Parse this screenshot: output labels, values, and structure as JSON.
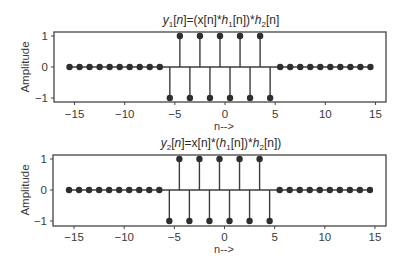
{
  "chart_data": [
    {
      "type": "stem",
      "title": "y1[n]=(x[n]*h1[n])*h2[n]",
      "title_parts": {
        "y": "y",
        "sub1": "1",
        "mid": "[n]=(x[n]*",
        "h1": "h",
        "sub_h1": "1",
        "mid2": "[n])*",
        "h2": "h",
        "sub_h2": "2",
        "end": "[n]"
      },
      "xlabel": "n-->",
      "ylabel": "Amplitude",
      "xlim": [
        -17,
        16
      ],
      "ylim": [
        -1.1,
        1.1
      ],
      "xticks": [
        -15,
        -10,
        -5,
        0,
        5,
        10,
        15
      ],
      "yticks": [
        -1,
        0,
        1
      ],
      "x": [
        -15.5,
        -14.5,
        -13.5,
        -12.5,
        -11.5,
        -10.5,
        -9.5,
        -8.5,
        -7.5,
        -6.5,
        -5.5,
        -4.5,
        -3.5,
        -2.5,
        -1.5,
        -0.5,
        0.5,
        1.5,
        2.5,
        3.5,
        4.5,
        5.5,
        6.5,
        7.5,
        8.5,
        9.5,
        10.5,
        11.5,
        12.5,
        13.5,
        14.5
      ],
      "values": [
        0,
        0,
        0,
        0,
        0,
        0,
        0,
        0,
        0,
        0,
        -1,
        1,
        -1,
        1,
        -1,
        1,
        -1,
        1,
        -1,
        1,
        -1,
        0,
        0,
        0,
        0,
        0,
        0,
        0,
        0,
        0,
        0
      ],
      "grid": false
    },
    {
      "type": "stem",
      "title": "y2[n]=x[n]*(h1[n])*h2[n])",
      "title_parts": {
        "y": "y",
        "sub1": "2",
        "mid": "[n]=x[n]*(",
        "h1": "h",
        "sub_h1": "1",
        "mid2": "[n])*",
        "h2": "h",
        "sub_h2": "2",
        "end": "[n])"
      },
      "xlabel": "n-->",
      "ylabel": "Amplitude",
      "xlim": [
        -17,
        16
      ],
      "ylim": [
        -1.1,
        1.1
      ],
      "xticks": [
        -15,
        -10,
        -5,
        0,
        5,
        10,
        15
      ],
      "yticks": [
        -1,
        0,
        1
      ],
      "x": [
        -15.5,
        -14.5,
        -13.5,
        -12.5,
        -11.5,
        -10.5,
        -9.5,
        -8.5,
        -7.5,
        -6.5,
        -5.5,
        -4.5,
        -3.5,
        -2.5,
        -1.5,
        -0.5,
        0.5,
        1.5,
        2.5,
        3.5,
        4.5,
        5.5,
        6.5,
        7.5,
        8.5,
        9.5,
        10.5,
        11.5,
        12.5,
        13.5,
        14.5
      ],
      "values": [
        0,
        0,
        0,
        0,
        0,
        0,
        0,
        0,
        0,
        0,
        -1,
        1,
        -1,
        1,
        -1,
        1,
        -1,
        1,
        -1,
        1,
        -1,
        0,
        0,
        0,
        0,
        0,
        0,
        0,
        0,
        0,
        0
      ],
      "grid": false
    }
  ],
  "colors": {
    "stem": "#3c3c3c",
    "marker": "#2e2e2e",
    "axis": "#444444"
  }
}
